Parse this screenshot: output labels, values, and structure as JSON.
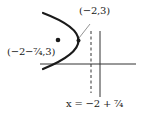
{
  "figure": {
    "type": "parabola-diagram",
    "labels": {
      "vertex": "(−2,3)",
      "focus": "(−2−⁷⁄₄,3)",
      "directrix": "x = −2 + ⁷⁄₄"
    },
    "points": {
      "vertex": {
        "x": -2,
        "y": 3
      },
      "focus": {
        "x": "-2-7/4",
        "y": 3
      }
    },
    "lines": {
      "directrix": {
        "equation": "x = -2 + 7/4",
        "style": "dashed"
      },
      "y_axis": {
        "style": "solid"
      },
      "x_axis": {
        "style": "solid"
      }
    },
    "colors": {
      "stroke": "#1a1a1a",
      "background": "#ffffff"
    }
  }
}
